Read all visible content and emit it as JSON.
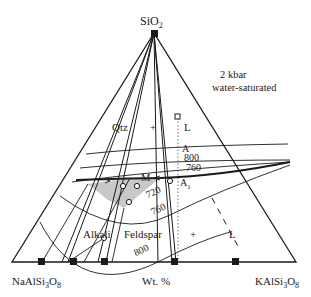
{
  "diagram": {
    "title_line1": "2 kbar",
    "title_line2": "water-saturated",
    "vertices": {
      "top": "SiO2",
      "left": "NaAlSi3O8",
      "right": "KAlSi3O8"
    },
    "axis_label": "Wt. %",
    "fields": {
      "qtz": "Qtz",
      "plus1": "+",
      "l1": "L",
      "alkali": "Alkali",
      "feldspar": "Feldspar",
      "plus2": "+",
      "l2": "L"
    },
    "points": {
      "a": "A",
      "a1": "A",
      "a1_sub": "1",
      "m": "M"
    },
    "isotherms": {
      "t800_top": "800",
      "t760_top": "760",
      "t720": "720",
      "t760_bottom": "760",
      "t800_bottom": "800"
    },
    "colors": {
      "line": "#1a1a1a",
      "shade": "#c8c8c8"
    }
  }
}
